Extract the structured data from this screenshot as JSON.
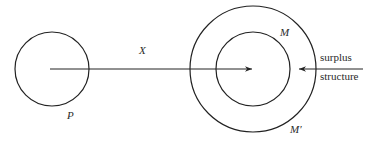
{
  "diagram": {
    "colors": {
      "stroke": "#222222",
      "text": "#2a2a2a",
      "background": "#ffffff"
    },
    "nodes": [
      {
        "id": "P",
        "label": "P",
        "shape": "circle"
      },
      {
        "id": "M",
        "label": "M",
        "shape": "circle",
        "note": "inner circle"
      },
      {
        "id": "M_prime",
        "label": "M′",
        "shape": "circle",
        "note": "outer circle"
      }
    ],
    "edges": [
      {
        "from": "P",
        "to": "M",
        "label": "X",
        "direction": "right"
      },
      {
        "from": "surplus structure",
        "to": "M",
        "direction": "left"
      }
    ],
    "labels": {
      "x": "X",
      "p": "P",
      "m": "M",
      "m_prime": "M′",
      "surplus": "surplus",
      "structure": "structure"
    }
  }
}
